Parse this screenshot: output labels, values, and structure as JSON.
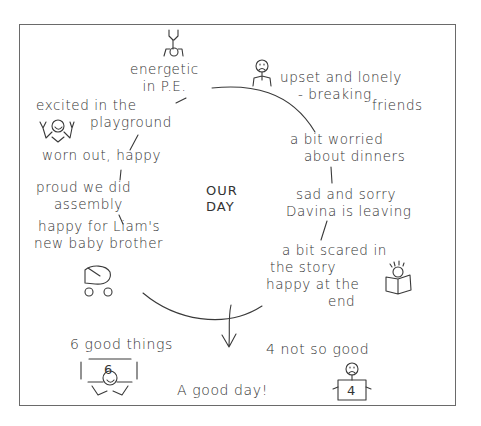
{
  "diagram": {
    "title_lines": [
      "OUR",
      "DAY"
    ],
    "events_clockwise": [
      {
        "id": "pe",
        "lines": [
          "energetic",
          "in P.E."
        ],
        "mood": "positive",
        "icon": "handstand-figure-icon"
      },
      {
        "id": "friends",
        "lines": [
          "upset and lonely",
          "- breaking",
          "friends"
        ],
        "mood": "negative",
        "icon": "sad-figure-icon"
      },
      {
        "id": "dinners",
        "lines": [
          "a bit worried",
          "about dinners"
        ],
        "mood": "negative"
      },
      {
        "id": "davina",
        "lines": [
          "sad and sorry",
          "Davina is leaving"
        ],
        "mood": "negative"
      },
      {
        "id": "story",
        "lines": [
          "a bit scared in",
          "the story",
          "happy at the",
          "end"
        ],
        "mood": "mixed",
        "icon": "reading-figure-icon"
      },
      {
        "id": "baby",
        "lines": [
          "happy for Liam's",
          "new baby brother"
        ],
        "mood": "positive",
        "icon": "pram-icon"
      },
      {
        "id": "assembly",
        "lines": [
          "proud we did",
          "assembly"
        ],
        "mood": "positive"
      },
      {
        "id": "wornout",
        "lines": [
          "worn out, happy"
        ],
        "mood": "positive"
      },
      {
        "id": "playground",
        "lines": [
          "excited in the",
          "playground"
        ],
        "mood": "positive",
        "icon": "cheering-figure-icon"
      }
    ],
    "summary": {
      "good": {
        "label": "6 good things",
        "count": "6",
        "icon": "happy-figure-holding-sign-icon"
      },
      "bad": {
        "label": "4 not so good",
        "count": "4",
        "icon": "sad-figure-holding-sign-icon"
      },
      "verdict": "A good day!"
    }
  }
}
